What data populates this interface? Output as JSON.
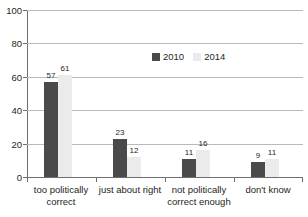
{
  "chart_data": {
    "type": "bar",
    "title": "",
    "subtitle": "",
    "xlabel": "",
    "ylabel": "",
    "ylim": [
      0,
      100
    ],
    "yticks": [
      0,
      20,
      40,
      60,
      80,
      100
    ],
    "ytick_labels": [
      "0",
      "20",
      "40",
      "60",
      "80",
      "100"
    ],
    "grid": "horizontal",
    "legend_position": "inside-upper-center",
    "categories": [
      "too politically correct",
      "just about right",
      "not politically correct enough",
      "don't know"
    ],
    "series": [
      {
        "name": "2010",
        "color": "#4a4a4a",
        "values": [
          57,
          23,
          11,
          9
        ],
        "labels": [
          "57",
          "23",
          "11",
          "9"
        ]
      },
      {
        "name": "2014",
        "color": "#ebebeb",
        "values": [
          61,
          12,
          16,
          11
        ],
        "labels": [
          "61",
          "12",
          "16",
          "11"
        ]
      }
    ]
  },
  "axis": {
    "line_color": "#6e6e6e",
    "grid_color": "#b9b9b9"
  }
}
